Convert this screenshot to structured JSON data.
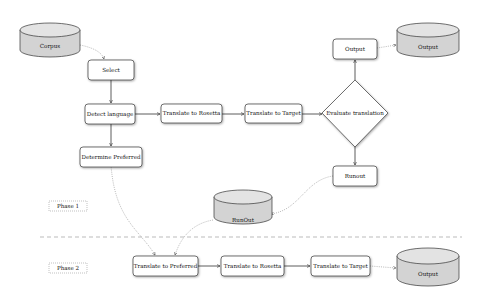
{
  "diagram": {
    "phase_labels": [
      "Phase 1",
      "Phase 2"
    ],
    "databases": {
      "corpus": "Corpus",
      "output_top": "Output",
      "runout_db": "RunOut",
      "output_bottom": "Output"
    },
    "nodes": {
      "select": "Select",
      "detect_language": "Detect language",
      "translate_rosetta_1": "Translate to Rosetta",
      "translate_target_1": "Translate to Target",
      "evaluate": "Evaluate translation",
      "output_box": "Output",
      "runout_box": "Runout",
      "determine_preferred": "Determine Preferred",
      "translate_preferred": "Translate to Preferred",
      "translate_rosetta_2": "Translate to Rosetta",
      "translate_target_2": "Translate to Target"
    },
    "colors": {
      "db_fill": "#d3d3d3",
      "db_top": "#e3e3e3",
      "stroke": "#333333",
      "box_fill": "#ffffff"
    }
  }
}
